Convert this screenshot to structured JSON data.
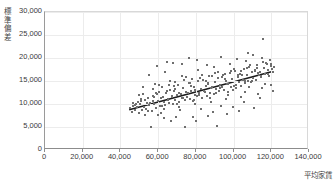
{
  "chart_data": {
    "type": "scatter",
    "title": "",
    "xlabel": "平均家賃",
    "ylabel": "標準偏差",
    "ylabel_chars": [
      "標",
      "準",
      "偏",
      "差"
    ],
    "xlim": [
      0,
      140000
    ],
    "ylim": [
      0,
      30000
    ],
    "xticks": [
      0,
      20000,
      40000,
      60000,
      80000,
      100000,
      120000,
      140000
    ],
    "xtick_labels": [
      "0",
      "20,000",
      "40,000",
      "60,000",
      "80,000",
      "100,000",
      "120,000",
      "140,000"
    ],
    "yticks": [
      0,
      5000,
      10000,
      15000,
      20000,
      25000,
      30000
    ],
    "ytick_labels": [
      "0",
      "5,000",
      "10,000",
      "15,000",
      "20,000",
      "25,000",
      "30,000"
    ],
    "grid": true,
    "legend": "none",
    "point_color": "#6e6e6e",
    "trendline_color": "#1a1a1a",
    "trendline": {
      "x0": 45000,
      "y0": 8600,
      "x1": 121000,
      "y1": 16900
    },
    "points": [
      [
        45200,
        9100
      ],
      [
        46100,
        8300
      ],
      [
        46800,
        9600
      ],
      [
        47500,
        8800
      ],
      [
        48200,
        10100
      ],
      [
        48900,
        9300
      ],
      [
        49600,
        8100
      ],
      [
        50300,
        9900
      ],
      [
        51000,
        10600
      ],
      [
        51700,
        8700
      ],
      [
        52400,
        9400
      ],
      [
        53100,
        10900
      ],
      [
        53800,
        9000
      ],
      [
        54500,
        11400
      ],
      [
        55200,
        9700
      ],
      [
        55900,
        10300
      ],
      [
        56600,
        8500
      ],
      [
        57300,
        11800
      ],
      [
        58000,
        10000
      ],
      [
        58700,
        9200
      ],
      [
        59400,
        12100
      ],
      [
        60100,
        10700
      ],
      [
        60800,
        9500
      ],
      [
        61500,
        11200
      ],
      [
        62200,
        13600
      ],
      [
        62900,
        10400
      ],
      [
        63600,
        9800
      ],
      [
        64300,
        12400
      ],
      [
        65000,
        11000
      ],
      [
        65700,
        10200
      ],
      [
        66400,
        13100
      ],
      [
        67100,
        11600
      ],
      [
        67800,
        9900
      ],
      [
        68500,
        12800
      ],
      [
        69200,
        10800
      ],
      [
        69900,
        11900
      ],
      [
        70600,
        14200
      ],
      [
        71300,
        10500
      ],
      [
        72000,
        12200
      ],
      [
        72700,
        11300
      ],
      [
        73400,
        13400
      ],
      [
        74100,
        10900
      ],
      [
        74800,
        12600
      ],
      [
        75500,
        11500
      ],
      [
        76200,
        14600
      ],
      [
        76900,
        11100
      ],
      [
        77600,
        12900
      ],
      [
        78300,
        10600
      ],
      [
        79000,
        13800
      ],
      [
        79700,
        12000
      ],
      [
        80400,
        11700
      ],
      [
        81100,
        14900
      ],
      [
        81800,
        12300
      ],
      [
        82500,
        13200
      ],
      [
        83200,
        11400
      ],
      [
        83900,
        15300
      ],
      [
        84600,
        12700
      ],
      [
        85300,
        13900
      ],
      [
        86000,
        11800
      ],
      [
        86700,
        14400
      ],
      [
        87400,
        12500
      ],
      [
        88100,
        13500
      ],
      [
        88800,
        16100
      ],
      [
        89500,
        12100
      ],
      [
        90200,
        14700
      ],
      [
        90900,
        13300
      ],
      [
        91600,
        15600
      ],
      [
        92300,
        12900
      ],
      [
        93000,
        14100
      ],
      [
        93700,
        13700
      ],
      [
        94400,
        16400
      ],
      [
        95100,
        13000
      ],
      [
        95800,
        15100
      ],
      [
        96500,
        14300
      ],
      [
        97200,
        12600
      ],
      [
        97900,
        16800
      ],
      [
        98600,
        13600
      ],
      [
        99300,
        15400
      ],
      [
        100000,
        14000
      ],
      [
        100700,
        17200
      ],
      [
        101400,
        13400
      ],
      [
        102100,
        15900
      ],
      [
        102800,
        14800
      ],
      [
        103500,
        16600
      ],
      [
        104200,
        13900
      ],
      [
        104900,
        15200
      ],
      [
        105600,
        17600
      ],
      [
        106300,
        14500
      ],
      [
        107000,
        16200
      ],
      [
        107700,
        15000
      ],
      [
        108400,
        18100
      ],
      [
        109100,
        14700
      ],
      [
        109800,
        16900
      ],
      [
        110500,
        15700
      ],
      [
        111200,
        17400
      ],
      [
        111900,
        15300
      ],
      [
        112600,
        18500
      ],
      [
        113300,
        16400
      ],
      [
        114000,
        17000
      ],
      [
        114700,
        15900
      ],
      [
        115400,
        24100
      ],
      [
        116100,
        17800
      ],
      [
        116800,
        16600
      ],
      [
        117500,
        18800
      ],
      [
        118200,
        17300
      ],
      [
        118900,
        16100
      ],
      [
        119600,
        18200
      ],
      [
        120300,
        17600
      ],
      [
        121000,
        16900
      ],
      [
        121700,
        18000
      ],
      [
        56000,
        5100
      ],
      [
        74300,
        5000
      ],
      [
        91200,
        5200
      ],
      [
        63100,
        6900
      ],
      [
        80100,
        6400
      ],
      [
        69500,
        7100
      ],
      [
        86200,
        7400
      ],
      [
        59800,
        7700
      ],
      [
        96300,
        7900
      ],
      [
        103100,
        8400
      ],
      [
        110900,
        9100
      ],
      [
        66700,
        6200
      ],
      [
        78400,
        7200
      ],
      [
        88900,
        8200
      ],
      [
        99500,
        9300
      ],
      [
        52900,
        7600
      ],
      [
        61400,
        8000
      ],
      [
        71800,
        8600
      ],
      [
        82600,
        8900
      ],
      [
        93400,
        9600
      ],
      [
        105400,
        10400
      ],
      [
        113800,
        11200
      ],
      [
        49100,
        10400
      ],
      [
        57800,
        11600
      ],
      [
        64900,
        12900
      ],
      [
        57100,
        13200
      ],
      [
        65600,
        14100
      ],
      [
        73900,
        15200
      ],
      [
        82100,
        15700
      ],
      [
        90400,
        16700
      ],
      [
        98800,
        17100
      ],
      [
        107200,
        17900
      ],
      [
        115800,
        19100
      ],
      [
        50700,
        11100
      ],
      [
        68300,
        13900
      ],
      [
        76800,
        14500
      ],
      [
        85400,
        15000
      ],
      [
        94100,
        15800
      ],
      [
        102600,
        16400
      ],
      [
        111600,
        17100
      ],
      [
        54100,
        10200
      ],
      [
        62600,
        11500
      ],
      [
        70900,
        12300
      ],
      [
        79600,
        13100
      ],
      [
        88300,
        13700
      ],
      [
        97000,
        14400
      ],
      [
        106100,
        15100
      ],
      [
        114400,
        16000
      ],
      [
        47900,
        9700
      ],
      [
        119100,
        19600
      ],
      [
        60200,
        12700
      ],
      [
        68900,
        13300
      ],
      [
        77300,
        14000
      ],
      [
        86600,
        14600
      ],
      [
        95700,
        15500
      ],
      [
        104600,
        16300
      ],
      [
        112900,
        16800
      ],
      [
        51900,
        12200
      ],
      [
        59100,
        12500
      ],
      [
        67400,
        11700
      ],
      [
        75900,
        12400
      ],
      [
        84100,
        12800
      ],
      [
        92700,
        13500
      ],
      [
        101200,
        14200
      ],
      [
        109600,
        14900
      ],
      [
        118400,
        16500
      ],
      [
        53400,
        9000
      ],
      [
        61900,
        9600
      ],
      [
        70200,
        10100
      ],
      [
        78900,
        10800
      ],
      [
        87700,
        11400
      ],
      [
        96800,
        12000
      ],
      [
        105900,
        12700
      ],
      [
        114900,
        13400
      ],
      [
        120100,
        14100
      ],
      [
        58400,
        14400
      ],
      [
        66100,
        15100
      ],
      [
        74700,
        15800
      ],
      [
        83300,
        16300
      ],
      [
        91900,
        17000
      ],
      [
        100400,
        17700
      ],
      [
        108900,
        18400
      ],
      [
        117100,
        19000
      ],
      [
        55400,
        16300
      ],
      [
        63800,
        17000
      ],
      [
        72500,
        16100
      ],
      [
        81300,
        17500
      ],
      [
        89700,
        18100
      ],
      [
        98200,
        18700
      ],
      [
        106700,
        19300
      ],
      [
        115100,
        20100
      ],
      [
        49800,
        11900
      ],
      [
        57400,
        10600
      ],
      [
        65300,
        10900
      ],
      [
        73100,
        11300
      ],
      [
        81700,
        11900
      ],
      [
        90700,
        12400
      ],
      [
        99900,
        13000
      ],
      [
        108100,
        13600
      ],
      [
        116500,
        14300
      ],
      [
        52200,
        13600
      ],
      [
        60600,
        14200
      ],
      [
        69100,
        14800
      ],
      [
        77900,
        15400
      ],
      [
        86900,
        16000
      ],
      [
        95400,
        16600
      ],
      [
        103900,
        17200
      ],
      [
        112300,
        17900
      ],
      [
        119800,
        18600
      ],
      [
        46500,
        10300
      ],
      [
        54700,
        8400
      ],
      [
        63300,
        8900
      ],
      [
        71100,
        9400
      ],
      [
        79300,
        9900
      ],
      [
        88000,
        10500
      ],
      [
        96100,
        11000
      ],
      [
        104100,
        11600
      ],
      [
        113100,
        12200
      ],
      [
        120800,
        12900
      ],
      [
        64500,
        19200
      ],
      [
        72900,
        18800
      ],
      [
        80700,
        19600
      ],
      [
        93100,
        20200
      ],
      [
        101900,
        19800
      ],
      [
        110200,
        20600
      ],
      [
        59600,
        18300
      ],
      [
        68100,
        19000
      ],
      [
        85700,
        18500
      ],
      [
        76400,
        20100
      ],
      [
        107900,
        21000
      ]
    ]
  }
}
